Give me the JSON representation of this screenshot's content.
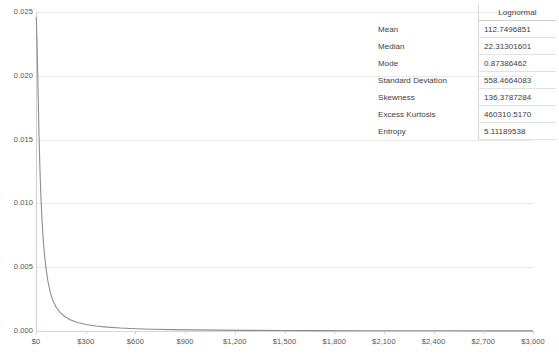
{
  "chart_data": {
    "type": "line",
    "title": "",
    "xlabel": "",
    "ylabel": "",
    "xlim": [
      0,
      3000
    ],
    "ylim": [
      0,
      0.025
    ],
    "grid": true,
    "legend": "none",
    "y_ticks": [
      "0.025",
      "0.020",
      "0.015",
      "0.010",
      "0.005",
      "0.000"
    ],
    "y_tick_values": [
      0.025,
      0.02,
      0.015,
      0.01,
      0.005,
      0
    ],
    "x_ticks": [
      "$0",
      "$300",
      "$600",
      "$900",
      "$1,200",
      "$1,500",
      "$1,800",
      "$2,100",
      "$2,400",
      "$2,700",
      "$3,000"
    ],
    "x_tick_values": [
      0,
      300,
      600,
      900,
      1200,
      1500,
      1800,
      2100,
      2400,
      2700,
      3000
    ],
    "series": [
      {
        "name": "Lognormal PDF",
        "color": "#8c8c8c",
        "x": [
          1,
          3,
          6,
          10,
          14,
          18,
          22,
          26,
          30,
          36,
          42,
          50,
          60,
          72,
          86,
          100,
          120,
          145,
          175,
          210,
          250,
          300,
          360,
          430,
          510,
          600,
          700,
          820,
          950,
          1100,
          1280,
          1480,
          1700,
          1950,
          2200,
          2500,
          2750,
          3000
        ],
        "y": [
          0.0246,
          0.0241,
          0.0228,
          0.0203,
          0.0178,
          0.0155,
          0.0135,
          0.0118,
          0.0104,
          0.00875,
          0.00745,
          0.00615,
          0.00495,
          0.0039,
          0.00302,
          0.00246,
          0.0019,
          0.00146,
          0.00112,
          0.00086,
          0.00067,
          0.00051,
          0.00039,
          0.0003,
          0.00023,
          0.00018,
          0.00014,
          0.00011,
          8.5e-05,
          6.7e-05,
          5.2e-05,
          4e-05,
          3.1e-05,
          2.4e-05,
          1.9e-05,
          1.5e-05,
          1.2e-05,
          1e-05
        ]
      }
    ]
  },
  "stats": {
    "header": {
      "corner": "",
      "column": "Lognormal"
    },
    "rows": [
      {
        "label": "Mean",
        "value": "112.7496851"
      },
      {
        "label": "Median",
        "value": "22.31301601"
      },
      {
        "label": "Mode",
        "value": "0.87386462"
      },
      {
        "label": "Standard Deviation",
        "value": "558.4664083"
      },
      {
        "label": "Skewness",
        "value": "136.3787284"
      },
      {
        "label": "Excess Kurtosis",
        "value": "460310.5170"
      },
      {
        "label": "Entropy",
        "value": "5.11189538"
      }
    ]
  }
}
